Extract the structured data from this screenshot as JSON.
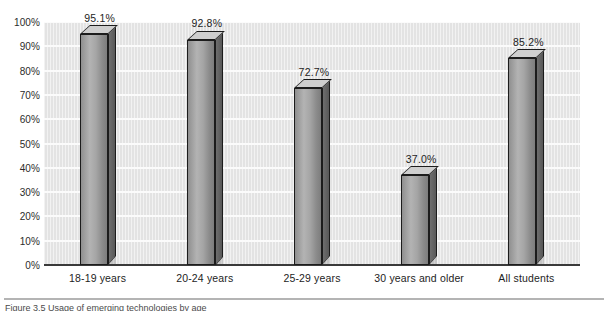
{
  "figure": {
    "caption": "Figure 3.5   Usage of emerging technologies by age",
    "background_color": "#ffffff",
    "plot_background_color": "#e3e3e3",
    "bar_fill_color": "#a8a8a8",
    "bar_outline_color": "#1c1c1c",
    "gridline_color": "#fbfbfb",
    "axis_color": "#3a3a3a"
  },
  "chart_data": {
    "type": "bar",
    "title": "",
    "xlabel": "",
    "ylabel": "",
    "categories": [
      "18-19 years",
      "20-24 years",
      "25-29 years",
      "30 years and older",
      "All students"
    ],
    "values": [
      95.1,
      92.8,
      72.7,
      37.0,
      85.2
    ],
    "value_labels": [
      "95.1%",
      "92.8%",
      "72.7%",
      "37.0%",
      "85.2%"
    ],
    "ylim": [
      0,
      100
    ],
    "ytick_step": 10,
    "ytick_labels": [
      "100%",
      "90%",
      "80%",
      "70%",
      "60%",
      "50%",
      "40%",
      "30%",
      "20%",
      "10%",
      "0%"
    ],
    "ytick_values": [
      100,
      90,
      80,
      70,
      60,
      50,
      40,
      30,
      20,
      10,
      0
    ],
    "grid": true,
    "grid_axis": "y",
    "legend": false,
    "legend_position": "none",
    "style": "3d-bar-grayscale"
  }
}
